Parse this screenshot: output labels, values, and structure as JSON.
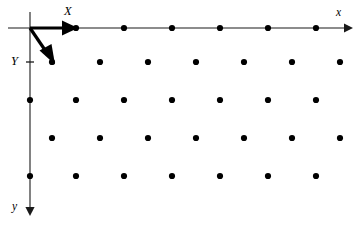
{
  "figure": {
    "background_color": "#ffffff",
    "width": 360,
    "height": 228
  },
  "labels": {
    "vector_x": "X",
    "vector_y": "Y",
    "axis_x": "x",
    "axis_y": "y"
  },
  "chart_data": {
    "type": "scatter",
    "title": "",
    "xlabel": "x",
    "ylabel": "y",
    "grid": false,
    "legend": null,
    "axis_color": "#1a1a1a",
    "dot_color": "#000000",
    "vector_color": "#000000",
    "origin": {
      "x": 30,
      "y": 28
    },
    "axes": [
      {
        "name": "x-axis",
        "label": "x",
        "orientation": "horizontal-right",
        "from": {
          "x": 8,
          "y": 28
        },
        "to": {
          "x": 350,
          "y": 28
        },
        "arrow": "end"
      },
      {
        "name": "y-axis",
        "label": "y",
        "orientation": "vertical-down",
        "from": {
          "x": 30,
          "y": 12
        },
        "to": {
          "x": 30,
          "y": 214
        },
        "arrow": "end"
      }
    ],
    "ticks": [
      {
        "axis": "y",
        "x": 30,
        "y": 62
      }
    ],
    "vectors": [
      {
        "name": "X",
        "label": "X",
        "from": {
          "x": 30,
          "y": 28
        },
        "to": {
          "x": 76,
          "y": 28
        },
        "arrow": "end"
      },
      {
        "name": "Y",
        "label": "Y",
        "from": {
          "x": 30,
          "y": 28
        },
        "to": {
          "x": 54,
          "y": 63
        },
        "arrow": "end"
      }
    ],
    "lattice_rows": [
      {
        "row": 0,
        "y": 28,
        "offset": "aligned",
        "x": [
          76,
          124,
          172,
          220,
          268,
          316
        ]
      },
      {
        "row": 1,
        "y": 62,
        "offset": "shifted",
        "x": [
          52,
          100,
          148,
          196,
          244,
          292,
          340
        ]
      },
      {
        "row": 2,
        "y": 100,
        "offset": "aligned",
        "x": [
          30,
          76,
          124,
          172,
          220,
          268,
          316
        ]
      },
      {
        "row": 3,
        "y": 138,
        "offset": "shifted",
        "x": [
          52,
          100,
          148,
          196,
          244,
          292,
          340
        ]
      },
      {
        "row": 4,
        "y": 176,
        "offset": "aligned",
        "x": [
          30,
          76,
          124,
          172,
          220,
          268,
          316
        ]
      }
    ],
    "dot_radius": 3.1,
    "lattice_spacing": {
      "a": 48,
      "b": 38,
      "shift": 22
    }
  }
}
